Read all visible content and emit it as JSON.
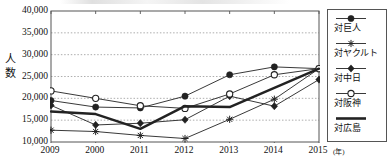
{
  "chart_data": {
    "type": "line",
    "title": "",
    "subtitle": "",
    "xlabel": "",
    "ylabel": "人数",
    "ylabel_chars": [
      "人",
      "数"
    ],
    "x_unit": "(年)",
    "categories": [
      "2009",
      "2000",
      "2011",
      "2012",
      "2013",
      "2014",
      "2015"
    ],
    "ylim": [
      10000,
      40000
    ],
    "ytick_step": 5000,
    "ytick_labels": [
      "40,000",
      "35,000",
      "30,000",
      "25,000",
      "20,000",
      "15,000",
      "10,000"
    ],
    "ytick_values": [
      40000,
      35000,
      30000,
      25000,
      20000,
      15000,
      10000
    ],
    "grid": "horizontal-dotted",
    "legend_position": "right",
    "series": [
      {
        "name": "対巨人",
        "marker": "filled-circle",
        "values": [
          19500,
          18000,
          17800,
          20500,
          25400,
          27200,
          26800
        ]
      },
      {
        "name": "対ヤクルト",
        "marker": "asterisk",
        "values": [
          12700,
          12400,
          11500,
          10800,
          15200,
          19800,
          26800
        ]
      },
      {
        "name": "対中日",
        "marker": "filled-diamond",
        "values": [
          18400,
          13900,
          14300,
          15100,
          20500,
          18200,
          24300
        ]
      },
      {
        "name": "対阪神",
        "marker": "open-circle",
        "values": [
          21700,
          20000,
          18300,
          17700,
          21000,
          25400,
          26800
        ]
      },
      {
        "name": "対広島",
        "marker": "thick-line",
        "values": [
          17000,
          16400,
          13000,
          18200,
          18000,
          22400,
          26800
        ]
      }
    ]
  },
  "legend": {
    "items": [
      {
        "label": "対巨人",
        "marker": "filled-circle"
      },
      {
        "label": "対ヤクルト",
        "marker": "asterisk"
      },
      {
        "label": "対中日",
        "marker": "filled-diamond"
      },
      {
        "label": "対阪神",
        "marker": "open-circle"
      },
      {
        "label": "対広島",
        "marker": "thick-line"
      }
    ]
  },
  "colors": {
    "axis": "#555555",
    "grid": "#999999",
    "series": "#222222",
    "text": "#111111",
    "background": "#ffffff"
  }
}
